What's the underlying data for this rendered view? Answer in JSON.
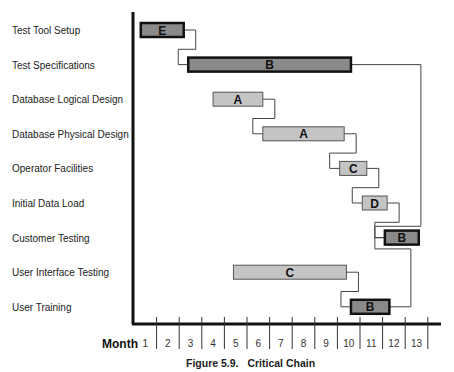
{
  "chart_data": {
    "type": "gantt",
    "title": "Critical Chain",
    "figure_label": "Figure 5.9.",
    "xlabel": "Month",
    "xlim": [
      0,
      13
    ],
    "x_ticks": [
      "1",
      "2",
      "3",
      "4",
      "5",
      "6",
      "7",
      "8",
      "9",
      "10",
      "11",
      "12",
      "13"
    ],
    "column_header": "Task",
    "colors": {
      "critical_fill": "#8a8a8a",
      "feeding_fill": "#c4c4c4",
      "border_critical": "#111111",
      "border_feeding": "#555555",
      "connector": "#444444"
    },
    "tasks": [
      {
        "name": "Test Tool Setup",
        "resource": "E",
        "start": 0.3,
        "end": 2.2,
        "critical": true
      },
      {
        "name": "Test Specifications",
        "resource": "B",
        "start": 2.4,
        "end": 9.6,
        "critical": true
      },
      {
        "name": "Database Logical Design",
        "resource": "A",
        "start": 3.5,
        "end": 5.7,
        "critical": false
      },
      {
        "name": "Database Physical Design",
        "resource": "A",
        "start": 5.7,
        "end": 9.3,
        "critical": false
      },
      {
        "name": "Operator Facilities",
        "resource": "C",
        "start": 9.1,
        "end": 10.3,
        "critical": false
      },
      {
        "name": "Initial Data Load",
        "resource": "D",
        "start": 10.1,
        "end": 11.2,
        "critical": false
      },
      {
        "name": "Customer Testing",
        "resource": "B",
        "start": 11.1,
        "end": 12.6,
        "critical": true
      },
      {
        "name": "User Interface Testing",
        "resource": "C",
        "start": 4.4,
        "end": 9.4,
        "critical": false
      },
      {
        "name": "User Training",
        "resource": "B",
        "start": 9.6,
        "end": 11.3,
        "critical": true
      }
    ],
    "connectors": [
      {
        "from": 0,
        "to": 1
      },
      {
        "from": 2,
        "to": 3
      },
      {
        "from": 3,
        "to": 4
      },
      {
        "from": 4,
        "to": 5
      },
      {
        "from": 5,
        "to": 6
      },
      {
        "from": 1,
        "to": 6
      },
      {
        "from": 7,
        "to": 8
      },
      {
        "from": 8,
        "to": 6
      }
    ]
  }
}
